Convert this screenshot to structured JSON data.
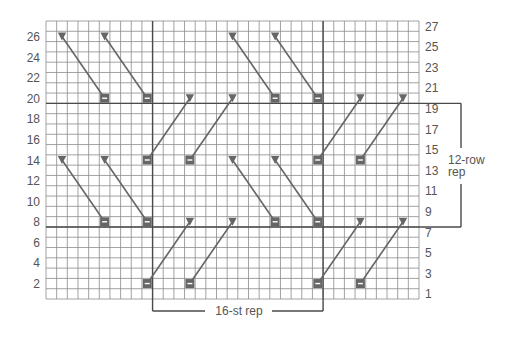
{
  "chart_data": {
    "type": "knitting-chart",
    "grid": {
      "columns": 35,
      "rows": 27
    },
    "row_labels_left": [
      2,
      4,
      6,
      8,
      10,
      12,
      14,
      16,
      18,
      20,
      22,
      24,
      26
    ],
    "row_labels_right": [
      1,
      3,
      5,
      7,
      9,
      11,
      13,
      15,
      17,
      19,
      21,
      23,
      25,
      27
    ],
    "stitch_repeat": {
      "label": "16-st rep",
      "from_col": 11,
      "to_col": 26
    },
    "row_repeat": {
      "label_line1": "12-row",
      "label_line2": "rep",
      "from_row": 8,
      "to_row": 19
    },
    "symbols": {
      "triangle": "decrease (dark triangle)",
      "rectangle": "bar stitch (dark box with white dash)"
    },
    "cables": [
      {
        "from": {
          "col": 2,
          "row": 26
        },
        "to": {
          "col": 6,
          "row": 20
        }
      },
      {
        "from": {
          "col": 6,
          "row": 26
        },
        "to": {
          "col": 10,
          "row": 20
        }
      },
      {
        "from": {
          "col": 18,
          "row": 26
        },
        "to": {
          "col": 22,
          "row": 20
        }
      },
      {
        "from": {
          "col": 22,
          "row": 26
        },
        "to": {
          "col": 26,
          "row": 20
        }
      },
      {
        "from": {
          "col": 14,
          "row": 20
        },
        "to": {
          "col": 10,
          "row": 14
        }
      },
      {
        "from": {
          "col": 18,
          "row": 20
        },
        "to": {
          "col": 14,
          "row": 14
        }
      },
      {
        "from": {
          "col": 30,
          "row": 20
        },
        "to": {
          "col": 26,
          "row": 14
        }
      },
      {
        "from": {
          "col": 34,
          "row": 20
        },
        "to": {
          "col": 30,
          "row": 14
        }
      },
      {
        "from": {
          "col": 2,
          "row": 14
        },
        "to": {
          "col": 6,
          "row": 8
        }
      },
      {
        "from": {
          "col": 6,
          "row": 14
        },
        "to": {
          "col": 10,
          "row": 8
        }
      },
      {
        "from": {
          "col": 18,
          "row": 14
        },
        "to": {
          "col": 22,
          "row": 8
        }
      },
      {
        "from": {
          "col": 22,
          "row": 14
        },
        "to": {
          "col": 26,
          "row": 8
        }
      },
      {
        "from": {
          "col": 14,
          "row": 8
        },
        "to": {
          "col": 10,
          "row": 2
        }
      },
      {
        "from": {
          "col": 18,
          "row": 8
        },
        "to": {
          "col": 14,
          "row": 2
        }
      },
      {
        "from": {
          "col": 30,
          "row": 8
        },
        "to": {
          "col": 26,
          "row": 2
        }
      },
      {
        "from": {
          "col": 34,
          "row": 8
        },
        "to": {
          "col": 30,
          "row": 2
        }
      }
    ]
  },
  "colors": {
    "grid_line": "#8a8a8a",
    "thick_line": "#4a4a4a",
    "symbol": "#666666",
    "label": "#555555"
  }
}
